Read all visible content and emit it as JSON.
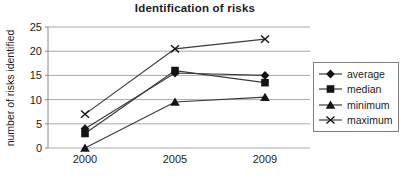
{
  "title": "Identification of risks",
  "chart_data": {
    "type": "line",
    "title": "Identification of risks",
    "xlabel": "",
    "ylabel": "number of risks identified",
    "categories": [
      "2000",
      "2005",
      "2009"
    ],
    "series": [
      {
        "name": "average",
        "marker": "diamond",
        "values": [
          4,
          15.5,
          15
        ]
      },
      {
        "name": "median",
        "marker": "square",
        "values": [
          3,
          16,
          13.5
        ]
      },
      {
        "name": "minimum",
        "marker": "triangle",
        "values": [
          0,
          9.5,
          10.5
        ]
      },
      {
        "name": "maximum",
        "marker": "x",
        "values": [
          7,
          20.5,
          22.5
        ]
      }
    ],
    "ylim": [
      0,
      25
    ],
    "yticks": [
      0,
      5,
      10,
      15,
      20,
      25
    ],
    "grid": true,
    "legend_position": "right"
  },
  "colors": {
    "background": "#ffffff",
    "grid": "#a9a9a9",
    "axis": "#8c8c8c",
    "series_line": "#3b3b3b",
    "marker": "#141414",
    "text": "#1c1c1c",
    "legend_border": "#7f7f7f"
  }
}
